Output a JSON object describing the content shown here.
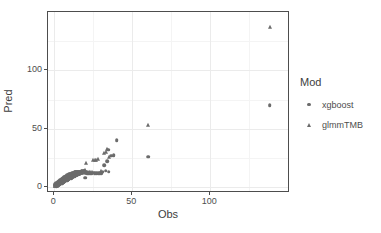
{
  "chart_data": {
    "type": "scatter",
    "title": "",
    "xlabel": "Obs",
    "ylabel": "Pred",
    "xlim": [
      -4,
      151
    ],
    "ylim": [
      -5,
      150
    ],
    "xticks": [
      0,
      50,
      100
    ],
    "yticks": [
      0,
      50,
      100
    ],
    "xtick_labels": [
      "0",
      "50",
      "100"
    ],
    "ytick_labels": [
      "0",
      "50",
      "100"
    ],
    "grid": true,
    "grid_major_color": "#ebebeb",
    "grid_minor_color": "#f4f4f4",
    "panel_border_color": "#4d4d4d",
    "point_color": "#6b6b6b",
    "legend_position": "right",
    "legend_title": "Mod",
    "series": [
      {
        "name": "xgboost",
        "marker": "circle",
        "color": "#6b6b6b",
        "points": [
          [
            0.5,
            1.2
          ],
          [
            0.8,
            1.6
          ],
          [
            1.0,
            2.0
          ],
          [
            1.2,
            1.4
          ],
          [
            1.4,
            2.6
          ],
          [
            1.6,
            3.1
          ],
          [
            1.8,
            2.2
          ],
          [
            2.0,
            3.4
          ],
          [
            2.2,
            2.8
          ],
          [
            2.4,
            4.0
          ],
          [
            2.6,
            3.2
          ],
          [
            2.8,
            4.6
          ],
          [
            3.0,
            3.8
          ],
          [
            3.2,
            5.0
          ],
          [
            3.4,
            4.2
          ],
          [
            3.6,
            5.4
          ],
          [
            3.8,
            4.6
          ],
          [
            4.0,
            6.0
          ],
          [
            4.2,
            5.0
          ],
          [
            4.4,
            6.4
          ],
          [
            4.6,
            5.6
          ],
          [
            4.8,
            6.8
          ],
          [
            5.0,
            5.2
          ],
          [
            5.2,
            7.2
          ],
          [
            5.4,
            6.0
          ],
          [
            5.6,
            7.6
          ],
          [
            5.8,
            6.6
          ],
          [
            6.0,
            8.0
          ],
          [
            6.2,
            6.8
          ],
          [
            6.4,
            8.4
          ],
          [
            6.6,
            7.2
          ],
          [
            6.8,
            8.8
          ],
          [
            7.0,
            7.6
          ],
          [
            7.2,
            9.0
          ],
          [
            7.4,
            8.0
          ],
          [
            7.6,
            9.4
          ],
          [
            7.8,
            8.4
          ],
          [
            8.0,
            9.8
          ],
          [
            8.2,
            8.6
          ],
          [
            8.4,
            10.0
          ],
          [
            8.6,
            9.0
          ],
          [
            8.8,
            10.4
          ],
          [
            9.0,
            9.4
          ],
          [
            9.2,
            10.6
          ],
          [
            9.4,
            9.8
          ],
          [
            9.6,
            11.0
          ],
          [
            9.8,
            10.2
          ],
          [
            10.0,
            11.2
          ],
          [
            10.4,
            10.4
          ],
          [
            10.8,
            11.6
          ],
          [
            11.2,
            10.8
          ],
          [
            11.6,
            12.0
          ],
          [
            12.0,
            11.2
          ],
          [
            12.4,
            12.2
          ],
          [
            12.8,
            11.6
          ],
          [
            13.2,
            12.6
          ],
          [
            13.6,
            12.0
          ],
          [
            14.0,
            12.8
          ],
          [
            14.4,
            12.2
          ],
          [
            14.8,
            13.0
          ],
          [
            15.2,
            12.6
          ],
          [
            15.6,
            13.2
          ],
          [
            16.0,
            12.8
          ],
          [
            16.4,
            13.4
          ],
          [
            17.0,
            13.0
          ],
          [
            17.6,
            13.6
          ],
          [
            18.2,
            13.2
          ],
          [
            18.8,
            13.8
          ],
          [
            19.4,
            13.4
          ],
          [
            20.0,
            8.0
          ],
          [
            20.5,
            13.0
          ],
          [
            21.0,
            12.0
          ],
          [
            22.0,
            11.8
          ],
          [
            23.0,
            12.2
          ],
          [
            24.0,
            11.6
          ],
          [
            25.0,
            12.4
          ],
          [
            26.0,
            12.0
          ],
          [
            27.0,
            11.8
          ],
          [
            28.0,
            12.2
          ],
          [
            29.0,
            12.0
          ],
          [
            30.0,
            11.8
          ],
          [
            31.0,
            13.4
          ],
          [
            32.0,
            18.8
          ],
          [
            33.0,
            14.0
          ],
          [
            34.0,
            22.0
          ],
          [
            34.5,
            32.0
          ],
          [
            35.0,
            13.2
          ],
          [
            36.5,
            27.0
          ],
          [
            38.0,
            27.6
          ],
          [
            40.0,
            40.0
          ],
          [
            60.0,
            26.0
          ],
          [
            138.0,
            70.0
          ],
          [
            1.1,
            0.8
          ],
          [
            1.9,
            1.2
          ],
          [
            2.7,
            1.9
          ],
          [
            3.5,
            2.4
          ],
          [
            4.3,
            3.0
          ],
          [
            5.1,
            3.6
          ],
          [
            5.9,
            4.2
          ],
          [
            6.7,
            4.8
          ],
          [
            7.5,
            5.4
          ],
          [
            8.3,
            6.0
          ],
          [
            9.1,
            6.6
          ],
          [
            9.9,
            7.2
          ],
          [
            10.7,
            7.8
          ],
          [
            11.5,
            8.4
          ],
          [
            12.3,
            9.0
          ],
          [
            13.1,
            9.6
          ],
          [
            13.9,
            10.2
          ],
          [
            14.7,
            10.8
          ],
          [
            15.5,
            11.2
          ],
          [
            16.3,
            11.6
          ],
          [
            0.6,
            2.4
          ],
          [
            1.3,
            3.2
          ],
          [
            2.1,
            4.0
          ],
          [
            2.9,
            4.8
          ],
          [
            3.7,
            5.6
          ],
          [
            4.5,
            6.4
          ],
          [
            5.3,
            7.0
          ],
          [
            6.1,
            7.8
          ],
          [
            6.9,
            8.4
          ],
          [
            7.7,
            9.0
          ],
          [
            8.5,
            9.6
          ],
          [
            9.3,
            10.2
          ],
          [
            10.1,
            10.8
          ],
          [
            10.9,
            11.4
          ],
          [
            11.7,
            11.8
          ],
          [
            12.5,
            12.2
          ],
          [
            13.3,
            12.6
          ],
          [
            14.1,
            13.0
          ],
          [
            15.0,
            13.2
          ],
          [
            16.8,
            13.4
          ],
          [
            18.0,
            13.6
          ],
          [
            19.0,
            13.8
          ]
        ]
      },
      {
        "name": "glmmTMB",
        "marker": "triangle",
        "color": "#6b6b6b",
        "points": [
          [
            0.4,
            1.0
          ],
          [
            0.9,
            1.8
          ],
          [
            1.3,
            2.4
          ],
          [
            1.7,
            2.0
          ],
          [
            2.1,
            3.0
          ],
          [
            2.5,
            3.6
          ],
          [
            2.9,
            3.0
          ],
          [
            3.3,
            4.2
          ],
          [
            3.7,
            3.6
          ],
          [
            4.1,
            4.8
          ],
          [
            4.5,
            4.2
          ],
          [
            4.9,
            5.4
          ],
          [
            5.3,
            4.8
          ],
          [
            5.7,
            6.0
          ],
          [
            6.1,
            5.4
          ],
          [
            6.5,
            6.6
          ],
          [
            6.9,
            6.0
          ],
          [
            7.3,
            7.2
          ],
          [
            7.7,
            6.6
          ],
          [
            8.1,
            7.8
          ],
          [
            8.5,
            7.2
          ],
          [
            8.9,
            8.4
          ],
          [
            9.3,
            7.8
          ],
          [
            9.7,
            9.0
          ],
          [
            10.1,
            8.4
          ],
          [
            10.5,
            9.6
          ],
          [
            10.9,
            9.0
          ],
          [
            11.3,
            10.0
          ],
          [
            11.7,
            9.4
          ],
          [
            12.1,
            10.4
          ],
          [
            12.5,
            9.8
          ],
          [
            12.9,
            10.8
          ],
          [
            13.3,
            10.2
          ],
          [
            13.7,
            11.2
          ],
          [
            14.1,
            10.6
          ],
          [
            14.5,
            11.6
          ],
          [
            14.9,
            11.0
          ],
          [
            15.3,
            12.0
          ],
          [
            15.7,
            11.4
          ],
          [
            16.1,
            12.2
          ],
          [
            16.6,
            11.8
          ],
          [
            17.2,
            12.6
          ],
          [
            17.8,
            12.2
          ],
          [
            18.4,
            13.0
          ],
          [
            19.0,
            12.6
          ],
          [
            19.6,
            13.4
          ],
          [
            20.0,
            14.8
          ],
          [
            20.5,
            21.0
          ],
          [
            21.0,
            13.0
          ],
          [
            22.0,
            13.4
          ],
          [
            23.0,
            12.8
          ],
          [
            24.0,
            13.2
          ],
          [
            25.0,
            23.0
          ],
          [
            26.0,
            23.6
          ],
          [
            27.0,
            23.4
          ],
          [
            28.0,
            23.8
          ],
          [
            30.0,
            13.6
          ],
          [
            32.0,
            29.0
          ],
          [
            33.0,
            30.5
          ],
          [
            34.0,
            32.6
          ],
          [
            35.0,
            26.0
          ],
          [
            60.0,
            53.0
          ],
          [
            138.0,
            137.0
          ],
          [
            0.7,
            0.6
          ],
          [
            1.5,
            1.4
          ],
          [
            2.3,
            2.2
          ],
          [
            3.1,
            2.8
          ],
          [
            3.9,
            3.4
          ],
          [
            4.7,
            4.0
          ],
          [
            5.5,
            4.6
          ],
          [
            6.3,
            5.2
          ],
          [
            7.1,
            5.8
          ],
          [
            7.9,
            6.4
          ],
          [
            8.7,
            7.0
          ],
          [
            9.5,
            7.6
          ],
          [
            10.3,
            8.2
          ],
          [
            11.1,
            8.8
          ],
          [
            11.9,
            9.2
          ],
          [
            12.7,
            9.8
          ],
          [
            13.5,
            10.4
          ],
          [
            14.3,
            11.0
          ],
          [
            15.1,
            11.4
          ],
          [
            15.9,
            11.8
          ],
          [
            17.0,
            12.4
          ],
          [
            18.2,
            13.2
          ],
          [
            19.2,
            13.8
          ],
          [
            20.2,
            12.2
          ]
        ]
      }
    ]
  },
  "axes": {
    "x_title": "Obs",
    "y_title": "Pred"
  },
  "legend": {
    "title": "Mod",
    "items": [
      {
        "label": "xgboost",
        "marker": "circle"
      },
      {
        "label": "glmmTMB",
        "marker": "triangle"
      }
    ]
  }
}
